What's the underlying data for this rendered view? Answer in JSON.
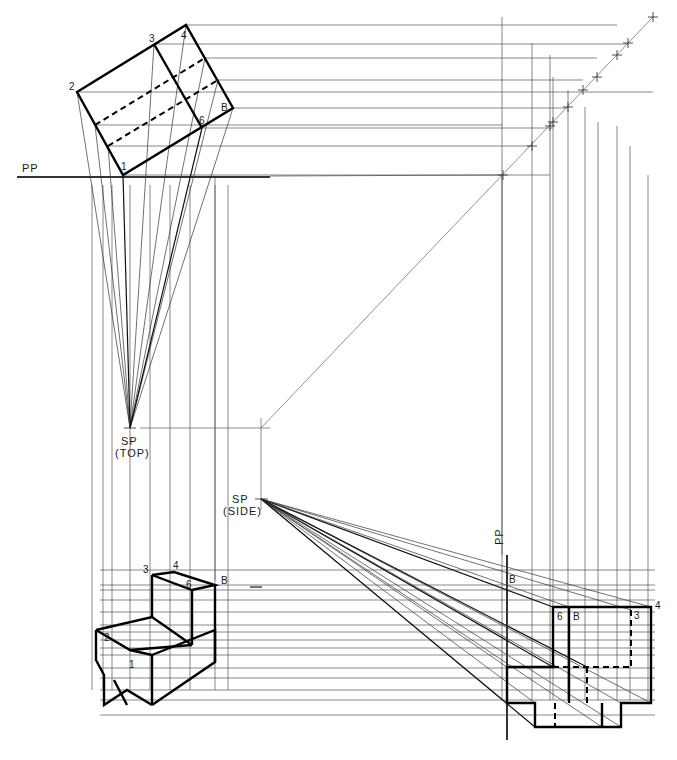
{
  "figure": {
    "colors": {
      "ink": "#000000",
      "construction": "#555555",
      "paper": "#ffffff"
    }
  },
  "labels": {
    "pp_top": "PP",
    "pp_side": "PP",
    "sp_top_1": "SP",
    "sp_top_2": "(TOP)",
    "sp_side_1": "SP",
    "sp_side_2": "(SIDE)",
    "top_view": {
      "p1": "1",
      "p2": "2",
      "p3": "3",
      "p4": "4",
      "p6": "6",
      "pB": "B"
    },
    "perspective": {
      "p1": "1",
      "p2": "2",
      "p3": "3",
      "p4": "4",
      "p6": "6",
      "pB": "B"
    },
    "side_view": {
      "p3": "3",
      "p4": "4",
      "p6": "6",
      "pB": "B"
    },
    "ray_markers": {
      "b_middle": "B",
      "b_pp": "B"
    }
  },
  "geometry": {
    "sp_top": [
      130,
      428
    ],
    "sp_side": [
      261,
      499
    ],
    "miter": [
      [
        653,
        17
      ],
      [
        261,
        428
      ]
    ],
    "pp_horizontal_y": 177,
    "pp_vertical_x": 507,
    "top_view_outline": [
      [
        77,
        92
      ],
      [
        186,
        25
      ],
      [
        233,
        108
      ],
      [
        123,
        175
      ]
    ],
    "top_view_inner": [
      [
        [
          154,
          44
        ],
        [
          202,
          128
        ]
      ]
    ],
    "top_view_hidden": [
      [
        [
          95,
          125
        ],
        [
          205,
          58
        ]
      ],
      [
        [
          108,
          146
        ],
        [
          218,
          80
        ]
      ]
    ],
    "top_points": [
      [
        77,
        92
      ],
      [
        154,
        44
      ],
      [
        186,
        25
      ],
      [
        205,
        58
      ],
      [
        218,
        80
      ],
      [
        233,
        108
      ],
      [
        202,
        128
      ],
      [
        123,
        175
      ],
      [
        108,
        146
      ],
      [
        95,
        125
      ]
    ],
    "miter_ticks": [
      [
        653,
        17
      ],
      [
        628,
        43
      ],
      [
        617,
        55
      ],
      [
        597,
        77
      ],
      [
        583,
        90
      ],
      [
        568,
        107
      ],
      [
        553,
        122
      ],
      [
        550,
        126
      ],
      [
        532,
        146
      ],
      [
        503,
        175
      ]
    ],
    "side_verticals": [
      502,
      532,
      550,
      553,
      568,
      585,
      598,
      617,
      630,
      648
    ],
    "horizontal_y_side": [
      570,
      585,
      590,
      600,
      612,
      625,
      632,
      640,
      648,
      655,
      668,
      678,
      690,
      700,
      715
    ],
    "left_verticals": [
      92,
      103,
      112,
      130,
      150,
      170,
      190,
      215,
      228
    ],
    "side_view_outline": [
      [
        553,
        607
      ],
      [
        651,
        607
      ],
      [
        651,
        703
      ],
      [
        621,
        703
      ],
      [
        621,
        727
      ],
      [
        535,
        727
      ],
      [
        535,
        703
      ],
      [
        507,
        703
      ],
      [
        507,
        667
      ],
      [
        553,
        667
      ]
    ],
    "side_view_inner": [
      [
        [
          569,
          607
        ],
        [
          569,
          703
        ]
      ],
      [
        [
          602,
          703
        ],
        [
          602,
          727
        ]
      ]
    ],
    "side_view_hidden": [
      [
        [
          631,
          610
        ],
        [
          631,
          667
        ]
      ],
      [
        [
          553,
          667
        ],
        [
          631,
          667
        ]
      ],
      [
        [
          587,
          667
        ],
        [
          587,
          703
        ]
      ],
      [
        [
          555,
          703
        ],
        [
          555,
          727
        ]
      ]
    ],
    "perspective_outline": [
      [
        [
          152,
          575
        ],
        [
          174,
          572
        ],
        [
          215,
          585
        ],
        [
          192,
          590
        ],
        [
          152,
          575
        ]
      ],
      [
        [
          152,
          575
        ],
        [
          152,
          617
        ]
      ],
      [
        [
          192,
          590
        ],
        [
          192,
          645
        ]
      ],
      [
        [
          215,
          585
        ],
        [
          215,
          662
        ]
      ],
      [
        [
          96,
          630
        ],
        [
          152,
          617
        ],
        [
          192,
          645
        ]
      ],
      [
        [
          96,
          630
        ],
        [
          96,
          660
        ],
        [
          104,
          675
        ],
        [
          104,
          705
        ],
        [
          127,
          690
        ],
        [
          152,
          705
        ]
      ],
      [
        [
          96,
          630
        ],
        [
          130,
          650
        ],
        [
          152,
          655
        ],
        [
          152,
          705
        ]
      ],
      [
        [
          130,
          650
        ],
        [
          192,
          645
        ]
      ],
      [
        [
          152,
          655
        ],
        [
          215,
          630
        ],
        [
          215,
          662
        ],
        [
          152,
          705
        ]
      ],
      [
        [
          114,
          680
        ],
        [
          127,
          705
        ]
      ]
    ]
  }
}
